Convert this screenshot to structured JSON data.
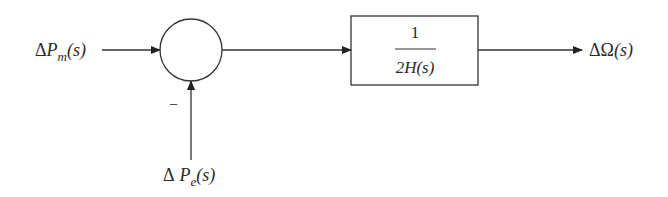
{
  "diagram": {
    "type": "block-diagram",
    "input_label": {
      "delta": "Δ",
      "var": "P",
      "sub": "m",
      "arg": "(s)"
    },
    "feedback_label": {
      "delta": "Δ",
      "var": "P",
      "sub": "e",
      "arg": "(s)"
    },
    "feedback_sign": "−",
    "summing_junction": {
      "shape": "circle"
    },
    "block": {
      "numerator": "1",
      "denominator": "2H(s)"
    },
    "output_label": {
      "delta": "Δ",
      "var": "Ω",
      "arg": "(s)"
    },
    "colors": {
      "stroke": "#333333",
      "text": "#2a2a2a",
      "background": "#ffffff"
    }
  }
}
